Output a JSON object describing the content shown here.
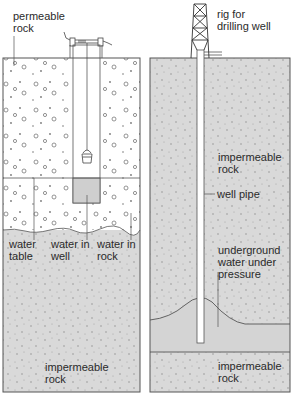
{
  "colors": {
    "outline": "#555555",
    "impermeable_fill": "#d9d9d9",
    "permeable_fill": "#ffffff",
    "water_fill": "#c8c8c8",
    "text": "#2a2a2a"
  },
  "left_panel": {
    "title": "ordinary well",
    "labels": {
      "permeable_rock": "permeable\nrock",
      "water_table": "water\ntable",
      "water_in_well": "water in\nwell",
      "water_in_rock": "water in\nrock",
      "impermeable_rock": "impermeable\nrock"
    }
  },
  "right_panel": {
    "title": "artesian well",
    "labels": {
      "rig": "rig for\ndrilling well",
      "impermeable_rock_top": "impermeable\nrock",
      "well_pipe": "well pipe",
      "underground_water": "underground\nwater under\npressure",
      "impermeable_rock_bottom": "impermeable\nrock"
    }
  }
}
